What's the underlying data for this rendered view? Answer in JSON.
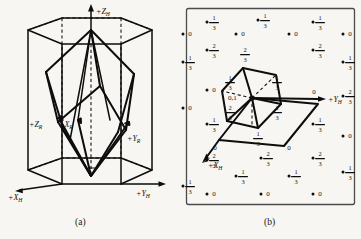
{
  "figure": {
    "background_color": "#f7f6f3",
    "ink_color": "#0d0d0d",
    "panels": [
      {
        "id": "a",
        "caption": "(a)",
        "description": "Rhombohedral unit cell inscribed in hexagonal prism"
      },
      {
        "id": "b",
        "caption": "(b)",
        "description": "Basal plane projection of rhombohedral lattice on hexagonal net"
      }
    ]
  },
  "panel_a": {
    "caption": "(a)",
    "axes": [
      {
        "name": "z-hexagonal-axis",
        "label": "+Z",
        "sub": "H"
      },
      {
        "name": "x-hexagonal-axis",
        "label": "+X",
        "sub": "H"
      },
      {
        "name": "y-hexagonal-axis",
        "label": "+Y",
        "sub": "H"
      },
      {
        "name": "z-rhombohedral-axis",
        "label": "+Z",
        "sub": "R"
      },
      {
        "name": "x-rhombohedral-axis",
        "label": "+X",
        "sub": "R"
      },
      {
        "name": "y-rhombohedral-axis",
        "label": "+Y",
        "sub": "R"
      }
    ]
  },
  "panel_b": {
    "caption": "(b)",
    "axes": [
      {
        "name": "y-hexagonal-axis",
        "label": "+Y",
        "sub": "H"
      },
      {
        "name": "x-hexagonal-axis",
        "label": "+X",
        "sub": "H"
      }
    ],
    "center_label": "0,1",
    "hexagon_vertex_labels": [
      "1/3",
      "1/3",
      "2/3",
      "1/3",
      "2/3",
      "2/3"
    ],
    "rhombus_corner_labels": [
      "0",
      "0",
      "0"
    ],
    "lattice_point_labels": [
      {
        "text": "1/3",
        "x": 214,
        "y": 22
      },
      {
        "text": "1/3",
        "x": 265,
        "y": 20
      },
      {
        "text": "1/3",
        "x": 320,
        "y": 22
      },
      {
        "text": "0",
        "x": 190,
        "y": 36
      },
      {
        "text": "0",
        "x": 243,
        "y": 36
      },
      {
        "text": "0",
        "x": 296,
        "y": 36
      },
      {
        "text": "0",
        "x": 350,
        "y": 36
      },
      {
        "text": "2/3",
        "x": 214,
        "y": 50
      },
      {
        "text": "2/3",
        "x": 320,
        "y": 50
      },
      {
        "text": "1/3",
        "x": 190,
        "y": 62
      },
      {
        "text": "1/3",
        "x": 350,
        "y": 62
      },
      {
        "text": "0",
        "x": 214,
        "y": 92
      },
      {
        "text": "0",
        "x": 190,
        "y": 110
      },
      {
        "text": "2/3",
        "x": 350,
        "y": 96
      },
      {
        "text": "1/3",
        "x": 214,
        "y": 124
      },
      {
        "text": "1/3",
        "x": 320,
        "y": 124
      },
      {
        "text": "0",
        "x": 350,
        "y": 138
      },
      {
        "text": "2/3",
        "x": 214,
        "y": 160
      },
      {
        "text": "2/3",
        "x": 268,
        "y": 158
      },
      {
        "text": "2/3",
        "x": 320,
        "y": 158
      },
      {
        "text": "1/3",
        "x": 243,
        "y": 176
      },
      {
        "text": "1/3",
        "x": 296,
        "y": 176
      },
      {
        "text": "1/3",
        "x": 350,
        "y": 172
      },
      {
        "text": "1/3",
        "x": 190,
        "y": 186
      },
      {
        "text": "0",
        "x": 214,
        "y": 196
      },
      {
        "text": "0",
        "x": 268,
        "y": 196
      },
      {
        "text": "0",
        "x": 320,
        "y": 196
      }
    ]
  }
}
